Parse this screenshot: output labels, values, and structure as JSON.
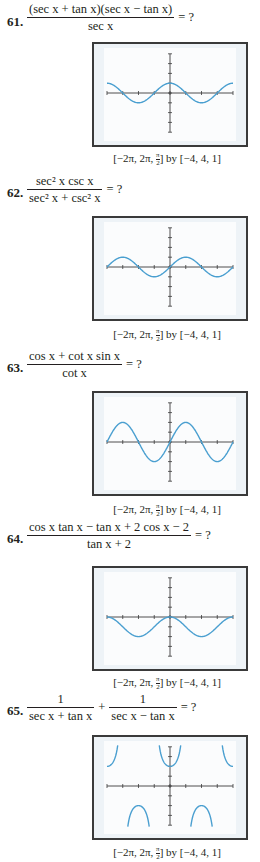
{
  "problems": [
    {
      "number": "61.",
      "numerator": "(sec x + tan x)(sec x − tan x)",
      "denominator": "sec x",
      "equals": "= ?",
      "window": "[−2π, 2π, π/2] by [−4, 4, 1]",
      "graph_function": "cos x"
    },
    {
      "number": "62.",
      "numerator": "sec² x csc x",
      "denominator": "sec² x + csc² x",
      "equals": "= ?",
      "window": "[−2π, 2π, π/2] by [−4, 4, 1]",
      "graph_function": "sin x"
    },
    {
      "number": "63.",
      "numerator": "cos x + cot x sin x",
      "denominator": "cot x",
      "equals": "= ?",
      "window": "[−2π, 2π, π/2] by [−4, 4, 1]",
      "graph_function": "2 sin x"
    },
    {
      "number": "64.",
      "numerator": "cos x tan x − tan x + 2 cos x − 2",
      "denominator": "tan x + 2",
      "equals": "= ?",
      "window": "[−2π, 2π, π/2] by [−4, 4, 1]",
      "graph_function": "cos x − 1"
    },
    {
      "number": "65.",
      "terms": [
        {
          "numerator": "1",
          "denominator": "sec x + tan x"
        },
        {
          "numerator": "1",
          "denominator": "sec x − tan x"
        }
      ],
      "plus": "+",
      "equals": "= ?",
      "window": "[−2π, 2π, π/2] by [−4, 4, 1]",
      "graph_function": "2 sec x"
    }
  ],
  "caption_parts": {
    "open": "[−2π, 2π, ",
    "pi": "π",
    "two": "2",
    "close": "] by [−4, 4, 1]"
  },
  "colors": {
    "curve": "#4a9fd0",
    "axis": "#3a3a3a",
    "frame": "#3a3a3a"
  },
  "chart_data": [
    {
      "type": "line",
      "title": "61",
      "function": "y = cos x",
      "xlim": [
        -6.2832,
        6.2832
      ],
      "xscale": 1.5708,
      "ylim": [
        -4,
        4
      ],
      "yscale": 1
    },
    {
      "type": "line",
      "title": "62",
      "function": "y = sin x",
      "xlim": [
        -6.2832,
        6.2832
      ],
      "xscale": 1.5708,
      "ylim": [
        -4,
        4
      ],
      "yscale": 1
    },
    {
      "type": "line",
      "title": "63",
      "function": "y = 2 sin x",
      "xlim": [
        -6.2832,
        6.2832
      ],
      "xscale": 1.5708,
      "ylim": [
        -4,
        4
      ],
      "yscale": 1
    },
    {
      "type": "line",
      "title": "64",
      "function": "y = cos x − 1",
      "xlim": [
        -6.2832,
        6.2832
      ],
      "xscale": 1.5708,
      "ylim": [
        -4,
        4
      ],
      "yscale": 1
    },
    {
      "type": "line",
      "title": "65",
      "function": "y = 2 sec x",
      "xlim": [
        -6.2832,
        6.2832
      ],
      "xscale": 1.5708,
      "ylim": [
        -4,
        4
      ],
      "yscale": 1
    }
  ]
}
